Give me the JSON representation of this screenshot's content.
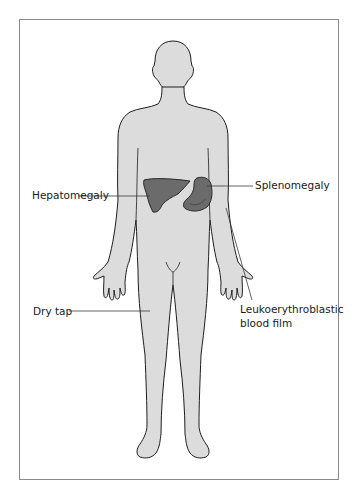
{
  "figure": {
    "colors": {
      "body_fill": "#dcdcdc",
      "body_outline": "#1e1e1e",
      "organ_fill": "#6b6b6b",
      "organ_outline": "#2a2a2a",
      "frame": "#8a8a8a",
      "leader_line": "#3a3a3a"
    }
  },
  "labels": {
    "hepatomegaly": "Hepatomegaly",
    "splenomegaly": "Splenomegaly",
    "dry_tap": "Dry tap",
    "leukoerythroblastic": "Leukoerythroblastic blood film"
  }
}
